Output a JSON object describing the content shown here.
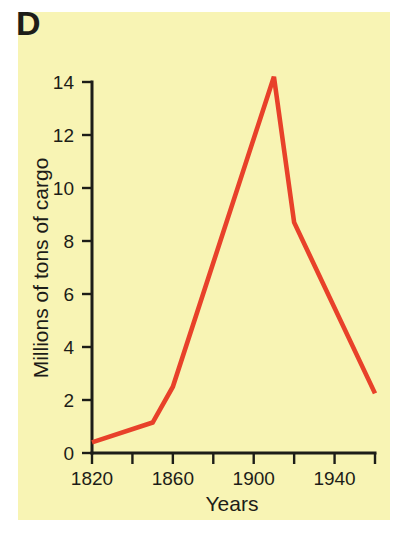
{
  "panel": {
    "label": "D",
    "background_color": "#f8f4b4",
    "page_background_color": "#ffffff"
  },
  "chart_data": {
    "type": "line",
    "title": "D",
    "xlabel": "Years",
    "ylabel": "Millions of tons of cargo",
    "xlim": [
      1820,
      1960
    ],
    "ylim": [
      0,
      14.6
    ],
    "grid": false,
    "legend": null,
    "line_color": "#e8412a",
    "axis_color": "#1d1d18",
    "x_ticks_major": [
      1820,
      1860,
      1900,
      1940
    ],
    "x_tick_labels": [
      "1820",
      "1860",
      "1900",
      "1940"
    ],
    "x_ticks_all": [
      1820,
      1840,
      1860,
      1880,
      1900,
      1920,
      1940,
      1960
    ],
    "y_ticks": [
      0,
      2,
      4,
      6,
      8,
      10,
      12,
      14
    ],
    "y_tick_labels": [
      "0",
      "2",
      "4",
      "6",
      "8",
      "10",
      "12",
      "14"
    ],
    "series": [
      {
        "name": "cargo",
        "color": "#e8412a",
        "x": [
          1820,
          1850,
          1860,
          1910,
          1920,
          1960
        ],
        "values": [
          0.4,
          1.15,
          2.5,
          14.2,
          8.7,
          2.25
        ]
      }
    ]
  }
}
